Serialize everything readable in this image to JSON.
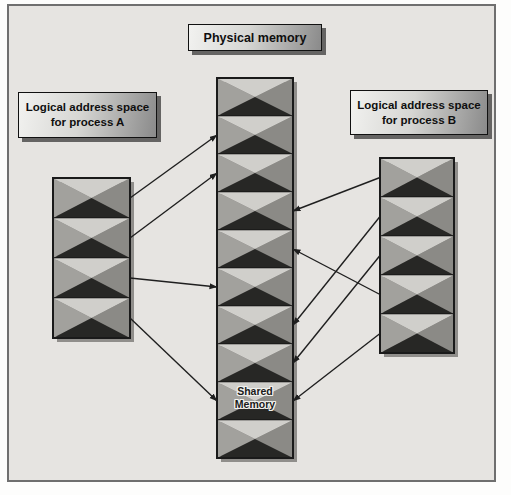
{
  "title_label": "Physical memory",
  "process_a_label": "Logical address space\nfor process A",
  "process_b_label": "Logical address space\nfor process B",
  "shared_memory_label": "Shared\nMemory",
  "columns": {
    "physical": {
      "key": "P",
      "name": "Physical memory",
      "block_count": 10,
      "shared_block": 9
    },
    "process_a": {
      "key": "A",
      "name": "Logical address space for process A",
      "block_count": 4
    },
    "process_b": {
      "key": "B",
      "name": "Logical address space for process B",
      "block_count": 5
    }
  },
  "mappings": [
    {
      "from": "A1",
      "to": "P2"
    },
    {
      "from": "A2",
      "to": "P3"
    },
    {
      "from": "A3",
      "to": "P6"
    },
    {
      "from": "A4",
      "to": "P9"
    },
    {
      "from": "B1",
      "to": "P4"
    },
    {
      "from": "B2",
      "to": "P7"
    },
    {
      "from": "B3",
      "to": "P8"
    },
    {
      "from": "B4",
      "to": "P5"
    },
    {
      "from": "B5",
      "to": "P9"
    }
  ],
  "colors": {
    "background": "#e6e4e1",
    "frame_border": "#6f6f6f",
    "block_top": "#d0cfcb",
    "block_left": "#a2a19d",
    "block_right": "#8b8a86",
    "block_bottom": "#272725",
    "column_border": "#1a1a1a",
    "label_border": "#111111",
    "label_gradient_start": "#f2f2f0",
    "label_gradient_end": "#8a8a8a",
    "arrow": "#1f1f1f",
    "text": "#0f0f0f"
  }
}
